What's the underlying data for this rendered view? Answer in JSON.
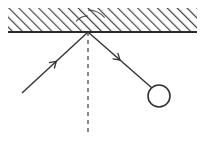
{
  "canvas": {
    "width": 203,
    "height": 151,
    "background": "#ffffff"
  },
  "colors": {
    "stroke": "#333333",
    "hatch": "#444444",
    "surface_line": "#2b2b2b",
    "dashed_normal": "#6b6b6b",
    "background": "#ffffff"
  },
  "surface": {
    "name": "hatched-mirror-surface",
    "label": "",
    "x_start": 8,
    "x_end": 197,
    "y_top": 8,
    "y_line": 32,
    "hatch_angle_deg": 45,
    "hatch_spacing": 7,
    "line_width": 2
  },
  "vertex": {
    "name": "reflection-point",
    "label": "",
    "x": 88,
    "y": 32
  },
  "incident_ray": {
    "name": "incident-ray",
    "label": "",
    "x1": 22,
    "y1": 93,
    "x2": 88,
    "y2": 32,
    "arrow_t": 0.52,
    "arrow_size": 7,
    "stroke_width": 1.4
  },
  "reflected_ray": {
    "name": "reflected-ray",
    "label": "",
    "x1": 88,
    "y1": 32,
    "x2": 152,
    "y2": 88,
    "arrow_t": 0.5,
    "arrow_size": 7,
    "stroke_width": 1.4
  },
  "ball": {
    "name": "ball-circle",
    "label": "",
    "cx": 159,
    "cy": 96,
    "r": 11,
    "fill": "none",
    "stroke_width": 1.6
  },
  "normal_line": {
    "name": "normal-dashed-line",
    "label": "",
    "x1": 88,
    "y1": 32,
    "x2": 88,
    "y2": 136,
    "dash": "4 4",
    "stroke_width": 1.6
  },
  "angle_arcs": [
    {
      "name": "angle-of-incidence-arc",
      "label": "",
      "radius": 16,
      "start_deg": 222,
      "end_deg": 270
    },
    {
      "name": "angle-of-reflection-arc",
      "label": "",
      "radius": 22,
      "start_deg": 270,
      "end_deg": 319
    }
  ]
}
